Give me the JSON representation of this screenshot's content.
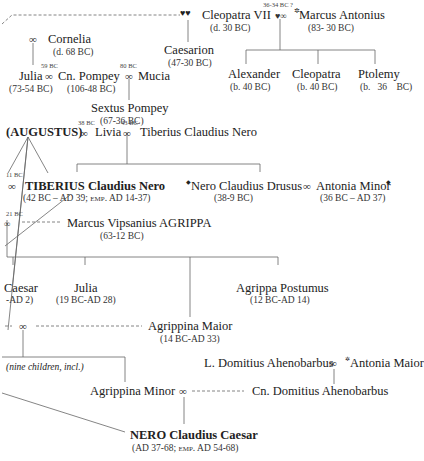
{
  "diagram": {
    "type": "family-tree",
    "marriage_symbol": "∞",
    "people": {
      "cleopatra_vii": {
        "name": "Cleopatra VII",
        "dates": "(d. 30 BC)"
      },
      "marcus_antonius": {
        "name": "Marcus Antonius",
        "dates": "(83- 30 BC)"
      },
      "caesarion": {
        "name": "Caesarion",
        "dates": "(47-30 BC)"
      },
      "cornelia": {
        "name": "Cornelia",
        "dates": "(d. 68 BC)"
      },
      "julia_pompey": {
        "name": "Julia",
        "dates": "(73-54 BC)"
      },
      "cn_pompey": {
        "name": "Cn. Pompey",
        "dates": "(106-48 BC)"
      },
      "mucia": {
        "name": "Mucia"
      },
      "sextus_pompey": {
        "name": "Sextus Pompey",
        "dates": "(67-36 BC)"
      },
      "alexander": {
        "name": "Alexander",
        "dates": "(b. 40 BC)"
      },
      "cleopatra_selene": {
        "name": "Cleopatra",
        "dates": "(b. 40 BC)"
      },
      "ptolemy": {
        "name": "Ptolemy",
        "dates": "(b.   36    BC)"
      },
      "augustus": {
        "name": "(AUGUSTUS)"
      },
      "livia": {
        "name": "Livia"
      },
      "tiberius_claudius_nero_sr": {
        "name": "Tiberius Claudius Nero"
      },
      "tiberius": {
        "name_sc": "TIBERIUS",
        "name_rest": " Claudius Nero",
        "dates": "(42 BC – AD 39; emp. AD 14-37)"
      },
      "drusus": {
        "name": "Nero Claudius Drusus",
        "dates": "(38-9 BC)"
      },
      "antonia_minor": {
        "name": "Antonia Minor",
        "dates": "(36 BC – AD 37)"
      },
      "agrippa": {
        "name": "Marcus Vipsanius A",
        "name_sc": "GRIPPA",
        "dates": "(63-12 BC)"
      },
      "gaius_caesar": {
        "name": "Caesar",
        "dates": "-AD 2)"
      },
      "julia_minor": {
        "name": "Julia",
        "dates": "(19 BC-AD 28)"
      },
      "agrippa_postumus": {
        "name": "Agrippa Postumus",
        "dates": "(12 BC-AD 14)"
      },
      "agrippina_maior": {
        "name": "Agrippina Maior",
        "dates": "(14 BC-AD 33)"
      },
      "l_domitius": {
        "name": "L. Domitius Ahenobarbus"
      },
      "antonia_maior": {
        "name": "Antonia Maior"
      },
      "agrippina_minor": {
        "name": "Agrippina Minor"
      },
      "cn_domitius": {
        "name": "Cn. Domitius Ahenobarbus"
      },
      "nero": {
        "name_sc": "NERO",
        "name_rest": " Claudius Caesar",
        "dates": "(AD 37-68; emp. AD 54-68)"
      }
    },
    "marriage_dates": {
      "antony_cleopatra": "36-34 BC ?",
      "julia_pompey": "59 BC",
      "pompey_mucia": "80 BC",
      "augustus_livia": "38 BC",
      "livia_tiberius_sr": "43 BC",
      "tiberius_julia": "11 BC",
      "agrippa_julia": "21 BC"
    },
    "notes": {
      "nine_children": "(nine children, incl.)"
    },
    "symbols": {
      "heart": "♥♥",
      "heart_single": "♥",
      "marriage": "∞",
      "diamond": "◆",
      "star": "✲"
    }
  }
}
